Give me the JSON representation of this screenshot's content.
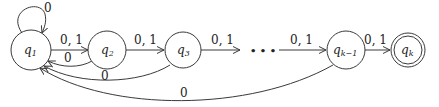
{
  "diagram": {
    "type": "finite-automaton",
    "states": [
      {
        "id": "q1",
        "label": "q",
        "sub": "1",
        "accepting": false
      },
      {
        "id": "q2",
        "label": "q",
        "sub": "2",
        "accepting": false
      },
      {
        "id": "q3",
        "label": "q",
        "sub": "3",
        "accepting": false
      },
      {
        "id": "qk1",
        "label": "q",
        "sub": "k−1",
        "accepting": false
      },
      {
        "id": "qk",
        "label": "q",
        "sub": "k",
        "accepting": true
      }
    ],
    "ellipsis": "• • •",
    "transitions": [
      {
        "from": "q1",
        "to": "q1",
        "label": "0"
      },
      {
        "from": "q1",
        "to": "q2",
        "label": "0, 1"
      },
      {
        "from": "q2",
        "to": "q3",
        "label": "0, 1"
      },
      {
        "from": "q3",
        "to": "...",
        "label": "0, 1"
      },
      {
        "from": "...",
        "to": "qk1",
        "label": "0, 1"
      },
      {
        "from": "qk1",
        "to": "qk",
        "label": "0, 1"
      },
      {
        "from": "q2",
        "to": "q1",
        "label": "0"
      },
      {
        "from": "q3",
        "to": "q1",
        "label": "0"
      },
      {
        "from": "qk1",
        "to": "q1",
        "label": "0"
      }
    ]
  }
}
